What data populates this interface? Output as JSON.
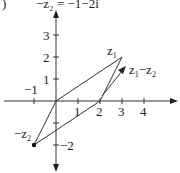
{
  "header": {
    "label": ")",
    "equation": "−z₂ = −1−2i"
  },
  "axes": {
    "x_ticks": [
      "−1",
      "1",
      "2",
      "3",
      "4"
    ],
    "y_ticks": [
      "3",
      "2",
      "1",
      "−2"
    ]
  },
  "points": {
    "z1": {
      "label": "z",
      "sub": "1",
      "coords": [
        3,
        2
      ]
    },
    "neg_z2": {
      "label": "−z",
      "sub": "2",
      "coords": [
        -1,
        -2
      ]
    },
    "diff": {
      "label": "z",
      "sub1": "1",
      "minus": "−z",
      "sub2": "2",
      "coords": [
        3,
        2
      ]
    }
  },
  "colors": {
    "stroke": "#333333"
  }
}
